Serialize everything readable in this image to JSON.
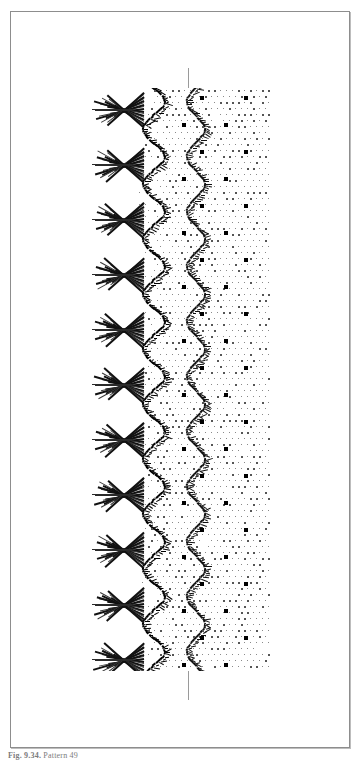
{
  "page": {
    "background_color": "#ffffff",
    "border_color": "#8d8d8d",
    "caption": "Fig. 9.34. Pattern 49",
    "caption_label": "Fig. 9.34.",
    "caption_title": "Pattern 49"
  },
  "figure": {
    "name": "textile-lace-pattern-plate",
    "kind": "repeating border pattern swatch",
    "ink_color": "#000000",
    "guideline_color": "#9a9a9a",
    "dot_ground_color": "#8a8a8a",
    "accent_dot_color": "#000000",
    "repeat_count": 11,
    "repeat_height_px": 55,
    "bands": [
      {
        "name": "chevron-feather-band",
        "position": "left"
      },
      {
        "name": "zigzag-spine-band",
        "position": "center-left"
      },
      {
        "name": "zigzag-secondary-band",
        "position": "center"
      },
      {
        "name": "halftone-dot-ground",
        "position": "right"
      }
    ]
  },
  "marks": {
    "guideline_label": "vertical registration line",
    "accent_dot_rows": 22
  }
}
